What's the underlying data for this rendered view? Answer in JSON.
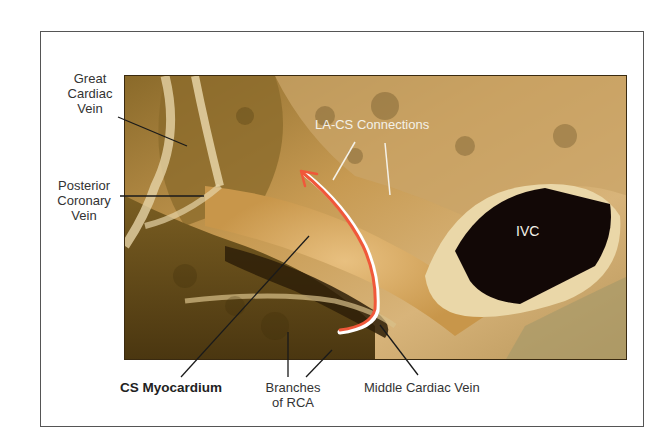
{
  "figure": {
    "labels": {
      "great_cardiac_vein": [
        "Great",
        "Cardiac",
        "Vein"
      ],
      "posterior_coronary_vein": [
        "Posterior",
        "Coronary",
        "Vein"
      ],
      "la_cs_connections": "LA-CS Connections",
      "ivc": "IVC",
      "cs_myocardium": "CS Myocardium",
      "branches_of_rca": [
        "Branches",
        "of RCA"
      ],
      "middle_cardiac_vein": "Middle Cardiac Vein"
    },
    "colors": {
      "arrow": "#f0583a",
      "arrow_outline": "#ffffff",
      "leader_dark": "#1a1a1a",
      "leader_light": "#f4f1e8",
      "tissue_light": "#d9a85a",
      "tissue_dark": "#5a4214",
      "ivc_lumen": "#120806"
    }
  }
}
